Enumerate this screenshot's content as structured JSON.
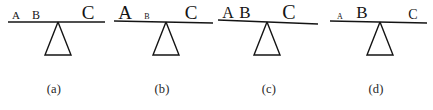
{
  "figure": {
    "background_color": "#ffffff",
    "ink_color": "#141414",
    "panels": [
      {
        "id": "a",
        "caption": "(a)",
        "beam": {
          "x1": 8,
          "y1": 22,
          "x2": 105,
          "y2": 22,
          "tilt": "level"
        },
        "fulcrum": {
          "apex_x": 58,
          "apex_y": 22,
          "base_y": 55,
          "half_width": 13
        },
        "weights": [
          {
            "label": "A",
            "x": 16,
            "size": 11
          },
          {
            "label": "B",
            "x": 36,
            "size": 12
          },
          {
            "label": "C",
            "x": 88,
            "size": 19
          }
        ]
      },
      {
        "id": "b",
        "caption": "(b)",
        "beam": {
          "x1": 6,
          "y1": 21,
          "x2": 105,
          "y2": 23,
          "tilt": "slight-right-down"
        },
        "fulcrum": {
          "apex_x": 58,
          "apex_y": 22,
          "base_y": 55,
          "half_width": 13
        },
        "weights": [
          {
            "label": "A",
            "x": 17,
            "size": 19
          },
          {
            "label": "B",
            "x": 39,
            "size": 8
          },
          {
            "label": "C",
            "x": 83,
            "size": 19
          }
        ]
      },
      {
        "id": "c",
        "caption": "(c)",
        "beam": {
          "x1": 3,
          "y1": 20,
          "x2": 103,
          "y2": 24,
          "tilt": "slight-right-down"
        },
        "fulcrum": {
          "apex_x": 52,
          "apex_y": 22,
          "base_y": 55,
          "half_width": 13
        },
        "weights": [
          {
            "label": "A",
            "x": 13,
            "size": 16
          },
          {
            "label": "B",
            "x": 30,
            "size": 17
          },
          {
            "label": "C",
            "x": 74,
            "size": 20
          }
        ]
      },
      {
        "id": "d",
        "caption": "(d)",
        "beam": {
          "x1": 8,
          "y1": 21,
          "x2": 105,
          "y2": 23,
          "tilt": "slight-right-down"
        },
        "fulcrum": {
          "apex_x": 58,
          "apex_y": 22,
          "base_y": 55,
          "half_width": 13
        },
        "weights": [
          {
            "label": "A",
            "x": 18,
            "size": 8
          },
          {
            "label": "B",
            "x": 40,
            "size": 17
          },
          {
            "label": "C",
            "x": 91,
            "size": 14
          }
        ]
      }
    ]
  }
}
